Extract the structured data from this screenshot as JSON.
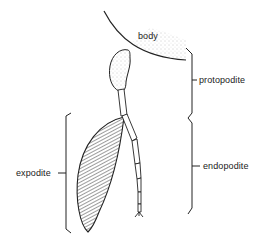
{
  "diagram": {
    "colors": {
      "ink": "#222222",
      "stipple": "#888888",
      "background": "#ffffff"
    },
    "labels": {
      "body": "body",
      "protopodite": "protopodite",
      "endopodite": "endopodite",
      "expodite": "expodite"
    },
    "parts": [
      {
        "name": "body",
        "style": "stippled curved edge"
      },
      {
        "name": "protopodite",
        "style": "bracketed right, basal segments"
      },
      {
        "name": "endopodite",
        "style": "bracketed right, jointed segmented branch ending in claw"
      },
      {
        "name": "expodite",
        "style": "bracketed left, hatched leaf-shaped lobe"
      }
    ]
  }
}
